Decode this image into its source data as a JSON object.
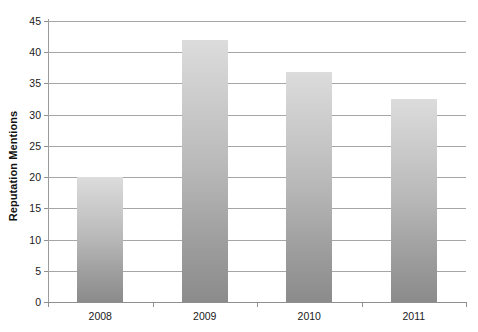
{
  "chart_data": {
    "type": "bar",
    "title": "",
    "xlabel": "",
    "ylabel": "Reputation Mentions",
    "categories": [
      "2008",
      "2009",
      "2010",
      "2011"
    ],
    "values": [
      20,
      42,
      36.8,
      32.5
    ],
    "ylim": [
      0,
      45
    ],
    "yticks": [
      0,
      5,
      10,
      15,
      20,
      25,
      30,
      35,
      40,
      45
    ],
    "ytick_labels": [
      "0",
      "5",
      "10",
      "15",
      "20",
      "25",
      "30",
      "35",
      "40",
      "45"
    ],
    "grid": "horizontal",
    "legend": "none",
    "series": [
      {
        "name": "Reputation Mentions",
        "values": [
          20,
          42,
          36.8,
          32.5
        ]
      }
    ],
    "bar_style": {
      "fill_top_color": "#dcdcdc",
      "fill_bottom_color": "#8b8b8b",
      "gradient_direction": "vertical"
    },
    "axis_color": "#8f8f8f",
    "gridline_color": "#a6a6a6",
    "background_color": "#ffffff",
    "text_color": "#1a1a1a"
  }
}
